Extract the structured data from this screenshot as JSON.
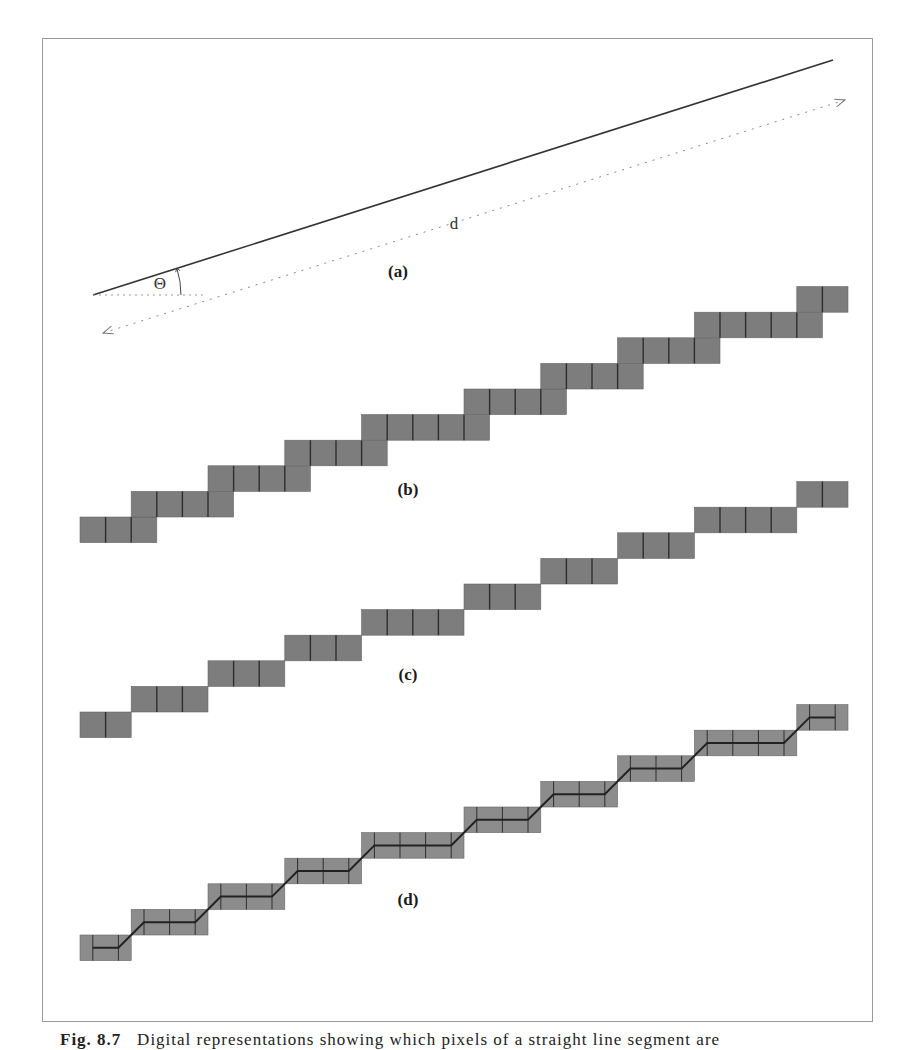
{
  "figure": {
    "caption_label": "Fig. 8.7",
    "caption_text": "Digital representations showing which pixels of a straight line segment are",
    "cell_size": 25.6,
    "origin_x": 80,
    "colors": {
      "frame": "#9a9a9a",
      "line": "#333333",
      "dotted": "#888888",
      "pixel_fill": "#7d7d7d",
      "pixel_fill_d": "#8c8c8c",
      "pixel_separator": "#2e2e2e",
      "chain": "#222222"
    }
  },
  "panels": {
    "a": {
      "label": "(a)",
      "label_pos": [
        398,
        262
      ],
      "angle_symbol": "Θ",
      "angle_symbol_pos": [
        160,
        284
      ],
      "distance_symbol": "d",
      "distance_symbol_pos": [
        454,
        224
      ],
      "line": {
        "x1": 93,
        "y1": 295,
        "x2": 833,
        "y2": 60
      },
      "horizontal_ref": {
        "x1": 93,
        "y1": 295,
        "x2": 205,
        "y2": 295
      },
      "distance_arrow": {
        "x1": 103,
        "y1": 333,
        "x2": 845,
        "y2": 100
      },
      "arc": {
        "cx": 93,
        "cy": 295,
        "r": 88
      }
    },
    "b": {
      "label": "(b)",
      "label_pos": [
        408,
        480
      ],
      "bottom_y": 517,
      "rows": [
        [
          0,
          2
        ],
        [
          2,
          5
        ],
        [
          5,
          8
        ],
        [
          8,
          11
        ],
        [
          11,
          15
        ],
        [
          15,
          18
        ],
        [
          18,
          21
        ],
        [
          21,
          24
        ],
        [
          24,
          28
        ],
        [
          28,
          29
        ]
      ]
    },
    "c": {
      "label": "(c)",
      "label_pos": [
        408,
        665
      ],
      "bottom_y": 712,
      "rows": [
        [
          0,
          1
        ],
        [
          2,
          4
        ],
        [
          5,
          7
        ],
        [
          8,
          10
        ],
        [
          11,
          14
        ],
        [
          15,
          17
        ],
        [
          18,
          20
        ],
        [
          21,
          23
        ],
        [
          24,
          27
        ],
        [
          28,
          29
        ]
      ]
    },
    "d": {
      "label": "(d)",
      "label_pos": [
        408,
        890
      ],
      "bottom_y": 935,
      "rows": [
        [
          0,
          1
        ],
        [
          2,
          4
        ],
        [
          5,
          7
        ],
        [
          8,
          10
        ],
        [
          11,
          14
        ],
        [
          15,
          17
        ],
        [
          18,
          20
        ],
        [
          21,
          23
        ],
        [
          24,
          27
        ],
        [
          28,
          29
        ]
      ]
    }
  }
}
